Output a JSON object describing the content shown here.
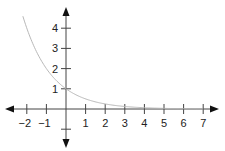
{
  "chart_data": {
    "type": "line",
    "title": "",
    "xlabel": "",
    "ylabel": "",
    "function": "y = (1/2)^x",
    "xlim": [
      -2.35,
      7.5
    ],
    "ylim": [
      -1.0,
      4.6
    ],
    "grid": false,
    "legend": null,
    "x_ticks": [
      -2,
      -1,
      1,
      2,
      3,
      4,
      5,
      6,
      7
    ],
    "x_tick_labels": [
      "−2",
      "−1",
      "1",
      "2",
      "3",
      "4",
      "5",
      "6",
      "7"
    ],
    "y_ticks": [
      1,
      2,
      3,
      4
    ],
    "y_tick_labels": [
      "1",
      "2",
      "3",
      "4"
    ],
    "series": [
      {
        "name": "exponential decay",
        "color": "#b8b8b8",
        "x": [
          -2.2,
          -2,
          -1.5,
          -1,
          -0.5,
          0,
          0.5,
          1,
          1.5,
          2,
          3,
          4,
          5,
          6,
          7
        ],
        "y": [
          4.59,
          4.0,
          2.83,
          2.0,
          1.41,
          1.0,
          0.71,
          0.5,
          0.35,
          0.25,
          0.125,
          0.0625,
          0.031,
          0.016,
          0.008
        ]
      }
    ],
    "axis_color": "#444444",
    "arrows": [
      "left",
      "right",
      "up",
      "down"
    ]
  }
}
